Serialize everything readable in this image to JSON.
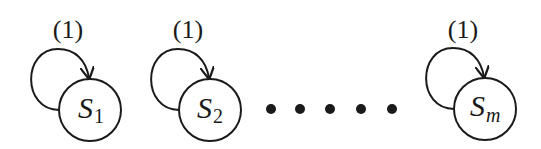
{
  "diagram": {
    "states": [
      {
        "name": "S",
        "subscript": "1",
        "loop_label": "(1)",
        "cx": 90
      },
      {
        "name": "S",
        "subscript": "2",
        "loop_label": "(1)",
        "cx": 210
      },
      {
        "name": "S",
        "subscript": "m",
        "loop_label": "(1)",
        "cx": 485
      }
    ],
    "ellipsis_dots": 5,
    "colors": {
      "stroke": "#1a1a1a",
      "background": "#ffffff"
    }
  }
}
